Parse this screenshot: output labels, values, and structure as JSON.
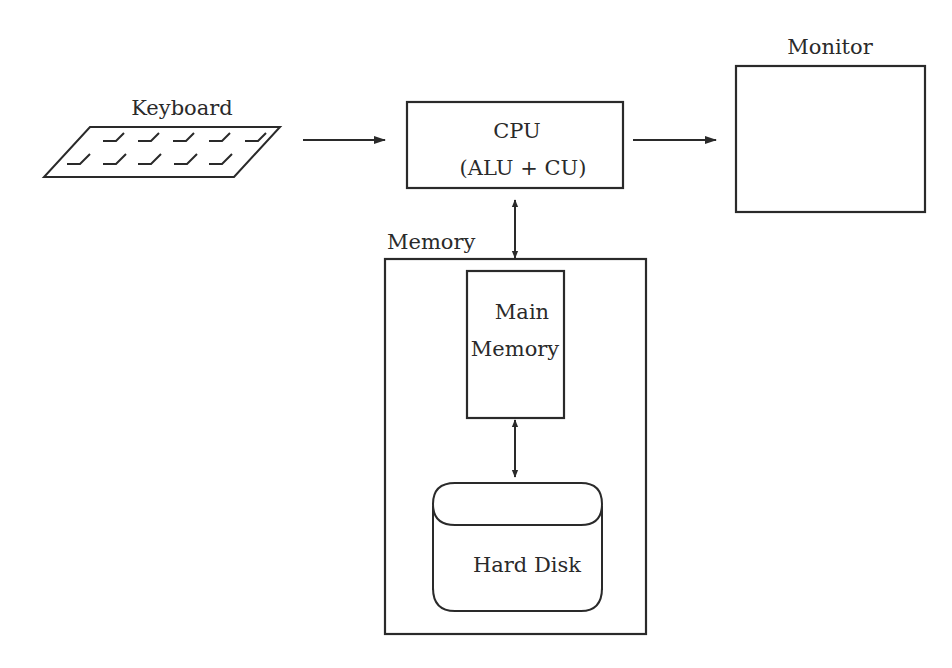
{
  "diagram": {
    "nodes": {
      "keyboard": {
        "label": "Keyboard",
        "icon": "keyboard-icon"
      },
      "cpu": {
        "label_line1": "CPU",
        "label_line2": "(ALU + CU)"
      },
      "monitor": {
        "label": "Monitor",
        "icon": "monitor-icon"
      },
      "memory": {
        "label": "Memory"
      },
      "main_memory": {
        "label_line1": "Main",
        "label_line2": "Memory"
      },
      "hard_disk": {
        "label": "Hard Disk",
        "icon": "disk-cylinder-icon"
      }
    },
    "edges": [
      {
        "from": "keyboard",
        "to": "cpu",
        "direction": "forward"
      },
      {
        "from": "cpu",
        "to": "monitor",
        "direction": "forward"
      },
      {
        "from": "cpu",
        "to": "memory",
        "direction": "bidirectional"
      },
      {
        "from": "main_memory",
        "to": "hard_disk",
        "direction": "bidirectional"
      }
    ],
    "colors": {
      "stroke": "#2a2a2a",
      "background": "#ffffff"
    }
  }
}
